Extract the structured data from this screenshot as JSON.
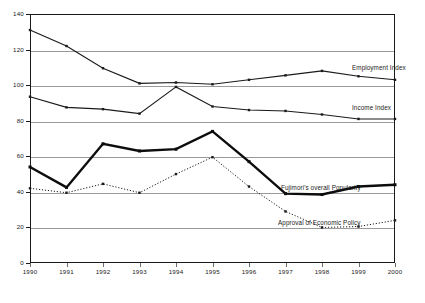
{
  "chart_data": {
    "type": "line",
    "title": "",
    "xlabel": "",
    "ylabel": "",
    "categories": [
      "1990",
      "1991",
      "1992",
      "1993",
      "1994",
      "1995",
      "1996",
      "1997",
      "1998",
      "1999",
      "2000"
    ],
    "x": [
      1990,
      1991,
      1992,
      1993,
      1994,
      1995,
      1996,
      1997,
      1998,
      1999,
      2000
    ],
    "ylim": [
      0,
      140
    ],
    "xlim": [
      1990,
      2000
    ],
    "yticks": [
      0,
      20,
      40,
      60,
      80,
      100,
      120,
      140
    ],
    "ytick_labels": [
      "0",
      "20",
      "40",
      "60",
      "80",
      "100",
      "120",
      "140"
    ],
    "grid": "horizontal",
    "legend_position": "inline-right-annotations",
    "series": [
      {
        "name": "Employment Index",
        "label": "Employment Index",
        "color": "#1a1a1a",
        "linestyle": "solid",
        "linewidth": 1.1,
        "marker": "square",
        "values": [
          131,
          122,
          109.5,
          101,
          101.5,
          100.5,
          103,
          105.5,
          108,
          105,
          103
        ]
      },
      {
        "name": "Income Index",
        "label": "Income Index",
        "color": "#1a1a1a",
        "linestyle": "solid",
        "linewidth": 1.1,
        "marker": "square",
        "values": [
          93.5,
          87.5,
          86.5,
          84,
          99,
          88,
          86,
          85.5,
          83.5,
          81,
          81
        ]
      },
      {
        "name": "Fujimori's overall Popularity",
        "label": "Fujimori's overall Popularity",
        "color": "#0d0d0d",
        "linestyle": "solid",
        "linewidth": 2.4,
        "marker": "square",
        "values": [
          54,
          42.5,
          67,
          63,
          64,
          74,
          57,
          39,
          38.5,
          43,
          44
        ]
      },
      {
        "name": "Approval of Economic Policy",
        "label": "Approval of Economic Policy",
        "color": "#1a1a1a",
        "linestyle": "dotted",
        "linewidth": 1.0,
        "marker": "square",
        "values": [
          42,
          39.5,
          44.5,
          39.5,
          50,
          59.5,
          43,
          29,
          20,
          20.5,
          24
        ]
      }
    ],
    "annotations": [
      {
        "text": "Employment Index",
        "series": "Employment Index",
        "x": 352,
        "y": 64
      },
      {
        "text": "Income Index",
        "series": "Income Index",
        "x": 352,
        "y": 104
      },
      {
        "text": "Fujimori's overall Popularity",
        "series": "Fujimori's overall Popularity",
        "x": 281,
        "y": 184
      },
      {
        "text": "Approval of Economic Policy",
        "series": "Approval of Economic Policy",
        "x": 278,
        "y": 219
      }
    ],
    "colors": {
      "axis": "#1a1a1a",
      "grid": "#9a9a9a",
      "background": "#ffffff",
      "text": "#1a1a1a"
    }
  }
}
